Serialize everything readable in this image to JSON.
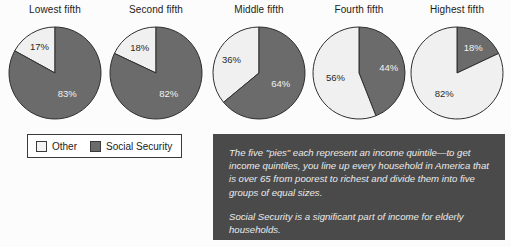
{
  "chart_data": {
    "type": "pie",
    "title": "",
    "subtitle": "",
    "xlabel": "",
    "ylabel": "",
    "legend_position": "bottom-left",
    "grid": false,
    "categories": [
      "Other",
      "Social Security"
    ],
    "charts": [
      {
        "title": "Lowest fifth",
        "slices": [
          {
            "name": "Other",
            "value": 17,
            "label": "17%",
            "color": "#f0f0f0",
            "start_deg": 0,
            "sweep_deg": -61.2,
            "label_on": "light"
          },
          {
            "name": "Social Security",
            "value": 83,
            "label": "83%",
            "color": "#6b6b6b",
            "start_deg": 0,
            "sweep_deg": 298.8,
            "label_on": "dark"
          }
        ]
      },
      {
        "title": "Second fifth",
        "slices": [
          {
            "name": "Other",
            "value": 18,
            "label": "18%",
            "color": "#f0f0f0",
            "start_deg": 0,
            "sweep_deg": -64.8,
            "label_on": "light"
          },
          {
            "name": "Social Security",
            "value": 82,
            "label": "82%",
            "color": "#6b6b6b",
            "start_deg": 0,
            "sweep_deg": 295.2,
            "label_on": "dark"
          }
        ]
      },
      {
        "title": "Middle fifth",
        "slices": [
          {
            "name": "Other",
            "value": 36,
            "label": "36%",
            "color": "#f0f0f0",
            "start_deg": 0,
            "sweep_deg": -129.6,
            "label_on": "light"
          },
          {
            "name": "Social Security",
            "value": 64,
            "label": "64%",
            "color": "#6b6b6b",
            "start_deg": 0,
            "sweep_deg": 230.4,
            "label_on": "dark"
          }
        ]
      },
      {
        "title": "Fourth fifth",
        "slices": [
          {
            "name": "Social Security",
            "value": 44,
            "label": "44%",
            "color": "#6b6b6b",
            "start_deg": 0,
            "sweep_deg": 158.4,
            "label_on": "dark"
          },
          {
            "name": "Other",
            "value": 56,
            "label": "56%",
            "color": "#f0f0f0",
            "start_deg": 0,
            "sweep_deg": -201.6,
            "label_on": "light"
          }
        ]
      },
      {
        "title": "Highest fifth",
        "slices": [
          {
            "name": "Social Security",
            "value": 18,
            "label": "18%",
            "color": "#6b6b6b",
            "start_deg": 0,
            "sweep_deg": 64.8,
            "label_on": "dark"
          },
          {
            "name": "Other",
            "value": 82,
            "label": "82%",
            "color": "#f0f0f0",
            "start_deg": 0,
            "sweep_deg": -295.2,
            "label_on": "light"
          }
        ]
      }
    ]
  },
  "legend": {
    "items": [
      {
        "label": "Other",
        "color": "#f4f4f4",
        "swatch": "other"
      },
      {
        "label": "Social Security",
        "color": "#6b6b6b",
        "swatch": "ss"
      }
    ]
  },
  "note": {
    "paragraphs": [
      "The five \"pies\" each represent an income quintile—to get income quintiles, you line up every household in America that is over 65 from poorest to richest and divide them into five groups of equal sizes.",
      "Social Security is a significant part of income for elderly households."
    ]
  },
  "colors": {
    "social_security": "#6b6b6b",
    "other": "#f0f0f0",
    "note_background": "#4a4a4a",
    "note_text": "#ebebeb",
    "page_background": "#fcfcfc",
    "outline": "#3a3a3a"
  }
}
